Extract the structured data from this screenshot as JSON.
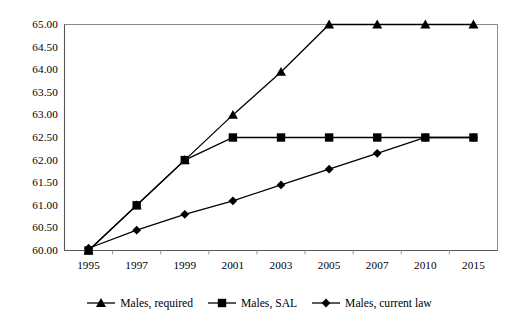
{
  "chart_data": {
    "type": "line",
    "title": "",
    "xlabel": "",
    "ylabel": "",
    "categories": [
      "1995",
      "1997",
      "1999",
      "2001",
      "2003",
      "2005",
      "2007",
      "2010",
      "2015"
    ],
    "ylim": [
      60.0,
      65.0
    ],
    "ytick_labels": [
      "65.00",
      "64.50",
      "64.00",
      "63.50",
      "63.00",
      "62.50",
      "62.00",
      "61.50",
      "61.00",
      "60.50",
      "60.00"
    ],
    "ytick_values": [
      65.0,
      64.5,
      64.0,
      63.5,
      63.0,
      62.5,
      62.0,
      61.5,
      61.0,
      60.5,
      60.0
    ],
    "grid": false,
    "legend_position": "bottom",
    "series": [
      {
        "name": "Males, required",
        "marker": "triangle",
        "color": "#000000",
        "values": [
          60.0,
          61.0,
          62.0,
          63.0,
          63.95,
          65.0,
          65.0,
          65.0,
          65.0
        ]
      },
      {
        "name": "Males, SAL",
        "marker": "square",
        "color": "#000000",
        "values": [
          60.0,
          61.0,
          62.0,
          62.5,
          62.5,
          62.5,
          62.5,
          62.5,
          62.5
        ]
      },
      {
        "name": "Males, current law",
        "marker": "diamond",
        "color": "#000000",
        "values": [
          60.05,
          60.45,
          60.8,
          61.1,
          61.45,
          61.8,
          62.15,
          62.5,
          62.5
        ]
      }
    ]
  },
  "legend": {
    "entries": [
      {
        "label": "Males, required",
        "marker": "triangle-marker-icon"
      },
      {
        "label": "Males, SAL",
        "marker": "square-marker-icon"
      },
      {
        "label": "Males, current law",
        "marker": "diamond-marker-icon"
      }
    ]
  }
}
